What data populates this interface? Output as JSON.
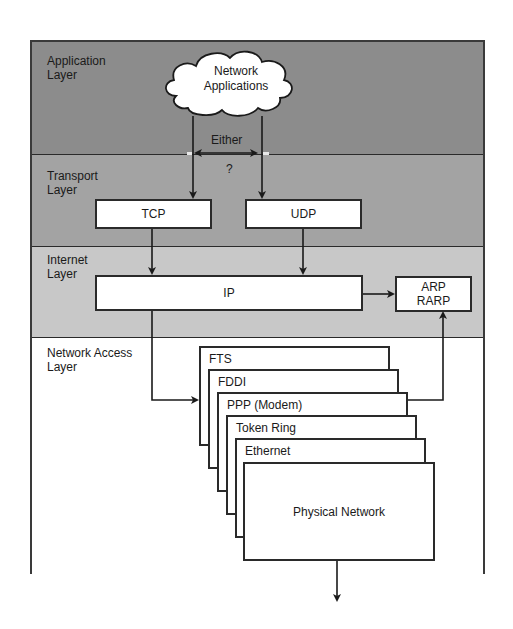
{
  "diagram": {
    "type": "layered-protocol-stack",
    "layers": [
      {
        "id": "application",
        "label": "Application\nLayer",
        "color": "#8c8c8c"
      },
      {
        "id": "transport",
        "label": "Transport\nLayer",
        "color": "#a3a3a3"
      },
      {
        "id": "internet",
        "label": "Internet\nLayer",
        "color": "#c8c8c8"
      },
      {
        "id": "network_access",
        "label": "Network Access\nLayer",
        "color": "#ffffff"
      }
    ],
    "cloud": {
      "label": "Network\nApplications"
    },
    "choice": {
      "label": "Either",
      "question": "?"
    },
    "transport_boxes": [
      {
        "id": "tcp",
        "label": "TCP"
      },
      {
        "id": "udp",
        "label": "UDP"
      }
    ],
    "internet_boxes": [
      {
        "id": "ip",
        "label": "IP"
      },
      {
        "id": "arp",
        "label": "ARP\nRARP"
      }
    ],
    "network_access_stack": [
      {
        "label": "FTS"
      },
      {
        "label": "FDDI"
      },
      {
        "label": "PPP (Modem)"
      },
      {
        "label": "Token Ring"
      },
      {
        "label": "Ethernet"
      }
    ],
    "physical": {
      "label": "Physical Network"
    },
    "line_color": "#1a1a1a"
  }
}
